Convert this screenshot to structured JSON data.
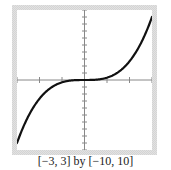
{
  "caption": "[−3, 3] by [−10, 10]",
  "colors": {
    "curve": "#111111",
    "axes": "#888888",
    "frame": "#e0e0e0",
    "background": "#ffffff"
  },
  "chart_data": {
    "type": "line",
    "title": "",
    "xlabel": "",
    "ylabel": "",
    "function": "y = x^3 / 3",
    "xlim": [
      -3,
      3
    ],
    "ylim": [
      -10,
      10
    ],
    "x_tick_step": 1,
    "y_tick_step": 1,
    "grid": false,
    "legend": null,
    "window_label": "[−3, 3] by [−10, 10]",
    "series": [
      {
        "name": "curve",
        "x": [
          -3,
          -2.5,
          -2,
          -1.5,
          -1,
          -0.5,
          0,
          0.5,
          1,
          1.5,
          2,
          2.5,
          3
        ],
        "values": [
          -9,
          -5.21,
          -2.67,
          -1.13,
          -0.33,
          -0.04,
          0,
          0.04,
          0.33,
          1.13,
          2.67,
          5.21,
          9
        ]
      }
    ]
  }
}
